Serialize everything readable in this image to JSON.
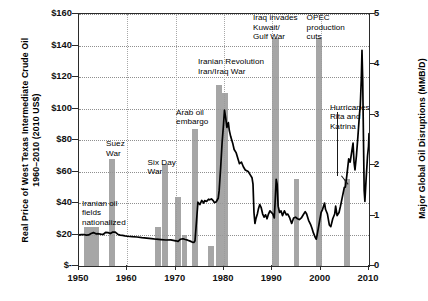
{
  "chart_data": {
    "type": "bar",
    "title": "",
    "subtitle": "",
    "xlabel": "",
    "ylabel": "Real Price of West Texas Intermediate Crude Oil\n1960–2010 (2010 US$)",
    "ylabel_right": "Major Global Oil Disruptions (MMB/D)",
    "xlim": [
      1950,
      2010
    ],
    "ylim": [
      0,
      160
    ],
    "ylim_right": [
      0,
      5
    ],
    "grid": true,
    "legend": "none",
    "y_ticks_left": [
      "$-",
      "$20",
      "$40",
      "$60",
      "$80",
      "$100",
      "$120",
      "$140",
      "$160"
    ],
    "y_tick_values_left": [
      0,
      20,
      40,
      60,
      80,
      100,
      120,
      140,
      160
    ],
    "y_ticks_right": [
      "0",
      "1",
      "2",
      "3",
      "4",
      "5"
    ],
    "y_tick_values_right": [
      0,
      1,
      2,
      3,
      4,
      5
    ],
    "x_ticks": [
      "1950",
      "1960",
      "1970",
      "1980",
      "1990",
      "2000",
      "2010"
    ],
    "x_tick_values": [
      1950,
      1960,
      1970,
      1980,
      1990,
      2000,
      2010
    ],
    "series": [
      {
        "name": "Major Global Oil Disruptions (MMB/D)",
        "type": "bar",
        "axis": "right",
        "color": "#9a9a9a",
        "bars": [
          {
            "label": "Iranian oil fields nationalized",
            "x_start": 1951.0,
            "x_end": 1954.2,
            "value": 0.78,
            "price_equiv": 25
          },
          {
            "label": "Suez War",
            "x_start": 1956.2,
            "x_end": 1957.4,
            "value": 2.12,
            "price_equiv": 68
          },
          {
            "label": "disruption 1966",
            "x_start": 1965.8,
            "x_end": 1967.0,
            "value": 0.78,
            "price_equiv": 25
          },
          {
            "label": "Six Day War",
            "x_start": 1967.2,
            "x_end": 1968.4,
            "value": 2.03,
            "price_equiv": 65
          },
          {
            "label": "disruption 1970",
            "x_start": 1969.9,
            "x_end": 1971.1,
            "value": 1.37,
            "price_equiv": 44
          },
          {
            "label": "disruption 1971",
            "x_start": 1971.3,
            "x_end": 1972.4,
            "value": 0.62,
            "price_equiv": 20
          },
          {
            "label": "Arab oil embargo",
            "x_start": 1973.4,
            "x_end": 1974.7,
            "value": 2.72,
            "price_equiv": 87
          },
          {
            "label": "disruption 1977",
            "x_start": 1976.7,
            "x_end": 1977.9,
            "value": 0.41,
            "price_equiv": 13
          },
          {
            "label": "Iranian Revolution",
            "x_start": 1978.3,
            "x_end": 1979.5,
            "value": 3.59,
            "price_equiv": 115
          },
          {
            "label": "Iran/Iraq War",
            "x_start": 1979.6,
            "x_end": 1980.8,
            "value": 3.44,
            "price_equiv": 110
          },
          {
            "label": "Iraq invades Kuwait/Gulf War",
            "x_start": 1990.0,
            "x_end": 1991.3,
            "value": 4.53,
            "price_equiv": 145
          },
          {
            "label": "disruption 1995",
            "x_start": 1994.4,
            "x_end": 1995.6,
            "value": 1.72,
            "price_equiv": 55
          },
          {
            "label": "OPEC production cuts",
            "x_start": 1999.0,
            "x_end": 2000.3,
            "value": 4.53,
            "price_equiv": 145
          },
          {
            "label": "Hurricanes Rita and Katrina",
            "x_start": 2004.8,
            "x_end": 2006.1,
            "value": 1.72,
            "price_equiv": 55
          }
        ]
      },
      {
        "name": "Real Price of West Texas Intermediate Crude Oil (2010 US$)",
        "type": "line",
        "axis": "left",
        "color": "#000000",
        "points": [
          [
            1950,
            19.8
          ],
          [
            1950.5,
            19.9
          ],
          [
            1951,
            20.0
          ],
          [
            1951.5,
            19.6
          ],
          [
            1952,
            19.7
          ],
          [
            1952.5,
            20.6
          ],
          [
            1953,
            21.2
          ],
          [
            1953.5,
            20.4
          ],
          [
            1954,
            20.5
          ],
          [
            1954.5,
            20.2
          ],
          [
            1955,
            20.0
          ],
          [
            1955.5,
            21.4
          ],
          [
            1956,
            21.2
          ],
          [
            1956.5,
            20.6
          ],
          [
            1957,
            21.6
          ],
          [
            1957.5,
            21.5
          ],
          [
            1958,
            20.2
          ],
          [
            1958.5,
            19.6
          ],
          [
            1959,
            19.4
          ],
          [
            1959.5,
            19.1
          ],
          [
            1960,
            18.9
          ],
          [
            1961,
            18.6
          ],
          [
            1962,
            18.4
          ],
          [
            1963,
            18.0
          ],
          [
            1964,
            17.7
          ],
          [
            1965,
            17.4
          ],
          [
            1966,
            17.0
          ],
          [
            1967,
            16.8
          ],
          [
            1968,
            16.5
          ],
          [
            1969,
            16.6
          ],
          [
            1970,
            16.0
          ],
          [
            1970.5,
            15.6
          ],
          [
            1971,
            17.0
          ],
          [
            1971.5,
            17.3
          ],
          [
            1972,
            16.8
          ],
          [
            1972.5,
            16.4
          ],
          [
            1973,
            15.8
          ],
          [
            1973.4,
            15.2
          ],
          [
            1973.8,
            15.0
          ],
          [
            1974,
            16.0
          ],
          [
            1974.3,
            28.0
          ],
          [
            1974.6,
            40.5
          ],
          [
            1975,
            39.0
          ],
          [
            1975.4,
            41.6
          ],
          [
            1975.8,
            40.0
          ],
          [
            1976,
            41.5
          ],
          [
            1976.4,
            41.0
          ],
          [
            1976.8,
            42.4
          ],
          [
            1977,
            42.0
          ],
          [
            1977.4,
            42.6
          ],
          [
            1977.8,
            41.3
          ],
          [
            1978,
            40.2
          ],
          [
            1978.4,
            40.8
          ],
          [
            1978.8,
            43.0
          ],
          [
            1979,
            48.0
          ],
          [
            1979.3,
            62.0
          ],
          [
            1979.6,
            78.0
          ],
          [
            1979.9,
            90.0
          ],
          [
            1980.1,
            99.0
          ],
          [
            1980.35,
            94.0
          ],
          [
            1980.6,
            88.0
          ],
          [
            1980.9,
            91.0
          ],
          [
            1981.1,
            86.0
          ],
          [
            1981.4,
            82.0
          ],
          [
            1981.8,
            78.0
          ],
          [
            1982.1,
            74.0
          ],
          [
            1982.5,
            72.0
          ],
          [
            1982.9,
            68.0
          ],
          [
            1983.2,
            65.0
          ],
          [
            1983.6,
            66.0
          ],
          [
            1984,
            63.0
          ],
          [
            1984.4,
            61.0
          ],
          [
            1985,
            60.0
          ],
          [
            1985.4,
            58.0
          ],
          [
            1985.8,
            56.0
          ],
          [
            1986.0,
            52.0
          ],
          [
            1986.2,
            34.0
          ],
          [
            1986.4,
            27.0
          ],
          [
            1986.6,
            30.0
          ],
          [
            1986.9,
            33.0
          ],
          [
            1987.1,
            36.0
          ],
          [
            1987.4,
            39.0
          ],
          [
            1987.7,
            37.0
          ],
          [
            1988,
            33.0
          ],
          [
            1988.3,
            31.0
          ],
          [
            1988.6,
            32.5
          ],
          [
            1988.9,
            30.0
          ],
          [
            1989.2,
            33.0
          ],
          [
            1989.5,
            35.0
          ],
          [
            1989.8,
            34.0
          ],
          [
            1990.1,
            33.0
          ],
          [
            1990.4,
            30.5
          ],
          [
            1990.6,
            42.0
          ],
          [
            1990.8,
            55.0
          ],
          [
            1991.0,
            52.0
          ],
          [
            1991.2,
            38.0
          ],
          [
            1991.5,
            34.0
          ],
          [
            1991.8,
            35.0
          ],
          [
            1992.1,
            32.0
          ],
          [
            1992.5,
            35.0
          ],
          [
            1992.9,
            32.5
          ],
          [
            1993.2,
            33.0
          ],
          [
            1993.6,
            30.5
          ],
          [
            1994,
            27.0
          ],
          [
            1994.4,
            30.5
          ],
          [
            1994.8,
            31.0
          ],
          [
            1995.2,
            30.0
          ],
          [
            1995.6,
            29.5
          ],
          [
            1996,
            30.5
          ],
          [
            1996.4,
            32.5
          ],
          [
            1996.8,
            34.5
          ],
          [
            1997.1,
            33.0
          ],
          [
            1997.5,
            29.0
          ],
          [
            1997.9,
            26.5
          ],
          [
            1998.2,
            24.0
          ],
          [
            1998.5,
            21.0
          ],
          [
            1998.9,
            18.0
          ],
          [
            1999.1,
            17.0
          ],
          [
            1999.4,
            22.0
          ],
          [
            1999.8,
            29.0
          ],
          [
            2000.1,
            34.0
          ],
          [
            2000.4,
            36.0
          ],
          [
            2000.8,
            40.0
          ],
          [
            2001.0,
            36.0
          ],
          [
            2001.4,
            33.0
          ],
          [
            2001.8,
            26.0
          ],
          [
            2002.1,
            25.0
          ],
          [
            2002.5,
            30.0
          ],
          [
            2002.9,
            33.0
          ],
          [
            2003.1,
            38.0
          ],
          [
            2003.4,
            32.0
          ],
          [
            2003.8,
            34.0
          ],
          [
            2004.1,
            38.0
          ],
          [
            2004.5,
            44.0
          ],
          [
            2004.9,
            50.0
          ],
          [
            2005.1,
            50.0
          ],
          [
            2005.4,
            57.0
          ],
          [
            2005.8,
            68.0
          ],
          [
            2006.1,
            66.0
          ],
          [
            2006.4,
            72.0
          ],
          [
            2006.7,
            78.0
          ],
          [
            2006.9,
            66.0
          ],
          [
            2007.1,
            61.0
          ],
          [
            2007.4,
            70.0
          ],
          [
            2007.7,
            82.0
          ],
          [
            2008.0,
            95.0
          ],
          [
            2008.2,
            102.0
          ],
          [
            2008.4,
            118.0
          ],
          [
            2008.55,
            137.0
          ],
          [
            2008.7,
            118.0
          ],
          [
            2008.85,
            82.0
          ],
          [
            2009.0,
            48.0
          ],
          [
            2009.15,
            41.0
          ],
          [
            2009.4,
            55.0
          ],
          [
            2009.7,
            70.0
          ],
          [
            2009.9,
            76.0
          ],
          [
            2010.0,
            84.0
          ],
          [
            2010.15,
            79.0
          ],
          [
            2010.3,
            74.0
          ],
          [
            2010.5,
            80.0
          ],
          [
            2010.7,
            86.0
          ],
          [
            2010.85,
            84.0
          ],
          [
            2011.0,
            87.0
          ]
        ]
      }
    ],
    "annotations": [
      {
        "id": "iranian-oil-fields",
        "text": "Iranian oil\nfields\nnationalized",
        "x": 1950.6,
        "y_price": 42
      },
      {
        "id": "suez-war",
        "text": "Suez\nWar",
        "x": 1955.6,
        "y_price": 80
      },
      {
        "id": "six-day-war",
        "text": "Six Day\nWar",
        "x": 1964.2,
        "y_price": 68
      },
      {
        "id": "arab-oil-embargo",
        "text": "Arab oil\nembargo",
        "x": 1970.1,
        "y_price": 100
      },
      {
        "id": "iranian-revolution",
        "text": "Iranian Revolution\nIran/Iraq War",
        "x": 1974.6,
        "y_price": 132
      },
      {
        "id": "iraq-invades-kuwait",
        "text": "Iraq invades\nKuwait/\nGulf War",
        "x": 1986.0,
        "y_price": 160
      },
      {
        "id": "opec-production-cuts",
        "text": "OPEC\nproduction\ncuts",
        "x": 1997.1,
        "y_price": 160
      },
      {
        "id": "hurricanes-rita-katrina",
        "text": "Hurricanes\nRita and\nKatrina",
        "x": 2001.9,
        "y_price": 103
      }
    ]
  }
}
